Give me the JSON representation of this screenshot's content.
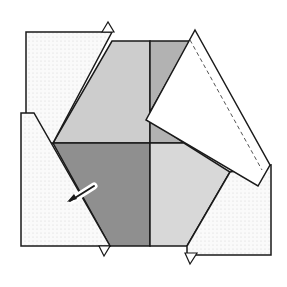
{
  "diagram": {
    "colors": {
      "paper_white": "#ffffff",
      "dotted_flap": "#f7f7f7",
      "light_gray": "#cfcfcf",
      "mid_gray": "#b4b4b4",
      "dark_gray": "#8e8e8e",
      "lighter_gray": "#dadada",
      "stroke": "#1a1a1a"
    },
    "parts": [
      {
        "name": "top-left-flap",
        "description": "dotted flap folded outward"
      },
      {
        "name": "right-flap",
        "description": "white flap folded over, dashed crease line"
      },
      {
        "name": "bottom-right-flap",
        "description": "dotted flap"
      },
      {
        "name": "left-flap",
        "description": "dotted flap with pointer arrow"
      },
      {
        "name": "center-square",
        "description": "four shaded quadrants"
      }
    ],
    "annotations": [
      {
        "name": "fold-arrow",
        "description": "arrow pointing to left flap edge"
      },
      {
        "name": "crease-line",
        "style": "dashed"
      }
    ]
  }
}
